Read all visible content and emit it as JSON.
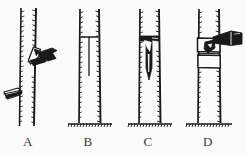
{
  "figure": {
    "background_color": "#fbfbfb",
    "ink_color": "#1a1a1a",
    "width": 246,
    "height": 155,
    "panel_count": 4
  },
  "panels": [
    {
      "id": "A",
      "caption": "A",
      "description": "Trunk with knife blade lifting a cut flap of bark; second knife at lower left",
      "trunk": {
        "left": 18,
        "right": 38,
        "top": 8,
        "bottom": 126
      },
      "has_ground_line": false,
      "elements": [
        "trunk",
        "bark-texture",
        "bark-flap",
        "knife-upper",
        "knife-lower"
      ]
    },
    {
      "id": "B",
      "caption": "B",
      "description": "Trunk with an inverted-T shaped incision cut into the bark",
      "trunk": {
        "left": 78,
        "right": 100,
        "top": 8,
        "bottom": 125
      },
      "has_ground_line": true,
      "elements": [
        "trunk",
        "bark-texture",
        "t-cut-horizontal",
        "t-cut-vertical",
        "ground-line"
      ]
    },
    {
      "id": "C",
      "caption": "C",
      "description": "Trunk with bark flaps opened revealing dark inner cut and inserted bud scion",
      "trunk": {
        "left": 138,
        "right": 160,
        "top": 8,
        "bottom": 125
      },
      "has_ground_line": true,
      "elements": [
        "trunk",
        "bark-texture",
        "opened-bark-flaps",
        "inserted-bud",
        "ground-line"
      ]
    },
    {
      "id": "D",
      "caption": "D",
      "description": "Trunk with graft wrapped in binding ties and a knife trimming the bud",
      "trunk": {
        "left": 196,
        "right": 220,
        "top": 8,
        "bottom": 125
      },
      "has_ground_line": true,
      "elements": [
        "trunk",
        "bark-texture",
        "wrap-band-upper",
        "wrap-band-lower",
        "bud-insert",
        "knife",
        "ground-line"
      ]
    }
  ],
  "captions": {
    "a": "A",
    "b": "B",
    "c": "C",
    "d": "D"
  }
}
